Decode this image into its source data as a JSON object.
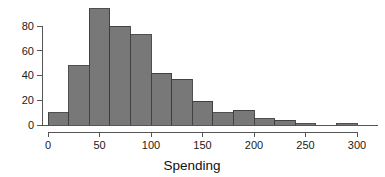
{
  "chart_data": {
    "type": "bar",
    "title": "",
    "subtitle": "",
    "xlabel": "Spending",
    "ylabel": "",
    "bin_width": 20,
    "bin_edges": [
      0,
      20,
      40,
      60,
      80,
      100,
      120,
      140,
      160,
      180,
      200,
      220,
      240,
      260,
      280,
      300
    ],
    "categories": [
      "0-20",
      "20-40",
      "40-60",
      "60-80",
      "80-100",
      "100-120",
      "120-140",
      "140-160",
      "160-180",
      "180-200",
      "200-220",
      "220-240",
      "240-260",
      "260-280",
      "280-300"
    ],
    "values": [
      10,
      48,
      94,
      80,
      73,
      42,
      37,
      19,
      10,
      12,
      5,
      4,
      1,
      0,
      1
    ],
    "xlim": [
      0,
      310
    ],
    "ylim": [
      0,
      96
    ],
    "x_ticks": [
      0,
      50,
      100,
      150,
      200,
      250,
      300
    ],
    "x_tick_labels": [
      "0",
      "50",
      "100",
      "150",
      "200",
      "250",
      "300"
    ],
    "y_ticks": [
      0,
      20,
      40,
      60,
      80
    ],
    "y_tick_labels": [
      "0",
      "20",
      "40",
      "60",
      "80"
    ],
    "grid": false,
    "legend": null,
    "bar_fill_color": "#787878",
    "bar_edge_color": "#3c3c3c",
    "axis_color": "#555555",
    "text_color": "#1a1a1a",
    "background_color": "#ffffff"
  },
  "axis_titles": {
    "x": "Spending"
  }
}
